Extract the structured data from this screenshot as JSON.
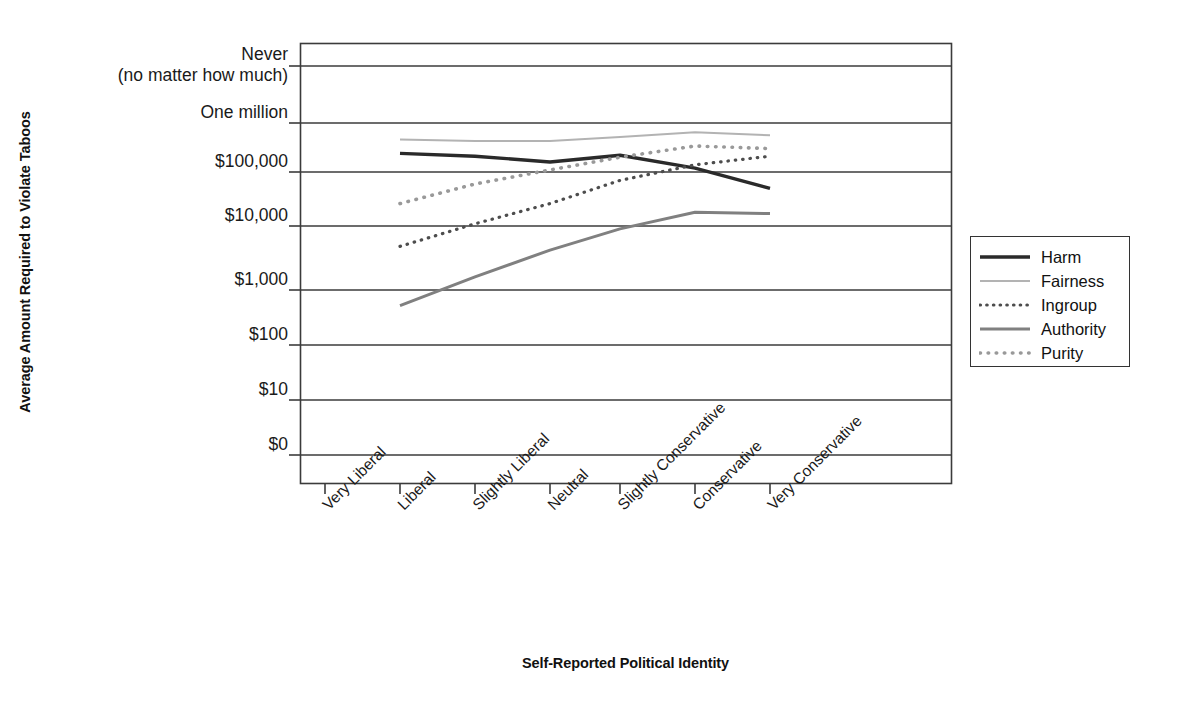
{
  "chart_data": {
    "type": "line",
    "title": "",
    "xlabel": "Self-Reported Political Identity",
    "ylabel": "Average Amount Required to Violate Taboos",
    "grid": true,
    "legend_position": "right",
    "categories": [
      "Very Liberal",
      "Liberal",
      "Slightly Liberal",
      "Neutral",
      "Slightly Conservative",
      "Conservative",
      "Very Conservative"
    ],
    "y_tick_labels": [
      "$0",
      "$10",
      "$100",
      "$1,000",
      "$10,000",
      "$100,000",
      "One million",
      "Never"
    ],
    "y_axis_top_note": "(no matter how much)",
    "y_scale": "log-like ordinal",
    "series": [
      {
        "name": "Harm",
        "style": "solid",
        "color": "#2a2a2a",
        "width": 3.4,
        "values": [
          null,
          240000,
          210000,
          160000,
          220000,
          120000,
          50000
        ]
      },
      {
        "name": "Fairness",
        "style": "solid",
        "color": "#b3b3b3",
        "width": 2.0,
        "values": [
          null,
          460000,
          430000,
          430000,
          520000,
          650000,
          560000
        ]
      },
      {
        "name": "Ingroup",
        "style": "dotted",
        "color": "#4d4d4d",
        "width": 3.2,
        "values": [
          null,
          4800,
          11000,
          26000,
          70000,
          140000,
          210000
        ]
      },
      {
        "name": "Authority",
        "style": "solid",
        "color": "#808080",
        "width": 3.0,
        "values": [
          null,
          520,
          1600,
          4200,
          9000,
          18000,
          17000
        ]
      },
      {
        "name": "Purity",
        "style": "dotted",
        "color": "#999999",
        "width": 3.6,
        "values": [
          null,
          26000,
          60000,
          110000,
          200000,
          340000,
          300000
        ]
      }
    ]
  },
  "legend": {
    "items": [
      {
        "label": "Harm"
      },
      {
        "label": "Fairness"
      },
      {
        "label": "Ingroup"
      },
      {
        "label": "Authority"
      },
      {
        "label": "Purity"
      }
    ]
  },
  "colors": {
    "axis": "#3b3b3b",
    "grid": "#3b3b3b",
    "text": "#1a1a1a",
    "background": "#ffffff"
  }
}
